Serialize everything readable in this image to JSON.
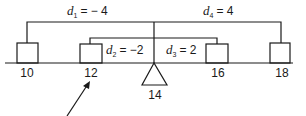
{
  "diagram": {
    "type": "balance-beam-deviations",
    "beam_positions": [
      {
        "value": "10",
        "label": "10"
      },
      {
        "value": "12",
        "label": "12"
      },
      {
        "value": "16",
        "label": "16"
      },
      {
        "value": "18",
        "label": "18"
      }
    ],
    "fulcrum": {
      "label": "14"
    },
    "deviations": [
      {
        "var": "d",
        "sub": "1",
        "expr": "= − 4"
      },
      {
        "var": "d",
        "sub": "2",
        "expr": "= −2"
      },
      {
        "var": "d",
        "sub": "3",
        "expr": "= 2"
      },
      {
        "var": "d",
        "sub": "4",
        "expr": "= 4"
      }
    ],
    "arrow_target": "12"
  }
}
